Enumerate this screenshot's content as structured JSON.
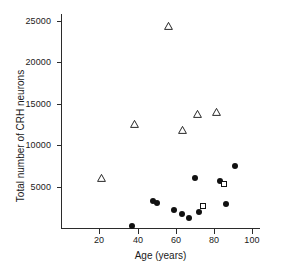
{
  "chart_data": {
    "type": "scatter",
    "title": "",
    "xlabel": "Age (years)",
    "ylabel": "Total number of  CRH neurons",
    "xlim": [
      0,
      104
    ],
    "ylim": [
      0,
      25800
    ],
    "xticks": [
      20,
      40,
      60,
      80,
      100
    ],
    "yticks": [
      5000,
      10000,
      15000,
      20000,
      25000
    ],
    "xtick_labels": [
      "20",
      "40",
      "60",
      "80",
      "100"
    ],
    "ytick_labels": [
      "5000",
      "10000",
      "15000",
      "20000",
      "25000"
    ],
    "grid": false,
    "legend": false,
    "marker_colors": {
      "filled_circle": "#111111",
      "open_triangle": "#111111",
      "open_square": "#111111",
      "axis": "#2b2b2b",
      "background": "#ffffff"
    },
    "series": [
      {
        "name": "open-triangle",
        "marker": "triangle-open",
        "points": [
          {
            "x": 21,
            "y": 6000
          },
          {
            "x": 38,
            "y": 12500
          },
          {
            "x": 56,
            "y": 24300
          },
          {
            "x": 63,
            "y": 11800
          },
          {
            "x": 71,
            "y": 13800
          },
          {
            "x": 81,
            "y": 14000
          }
        ]
      },
      {
        "name": "filled-circle",
        "marker": "circle-filled",
        "points": [
          {
            "x": 37,
            "y": 250
          },
          {
            "x": 48,
            "y": 3300
          },
          {
            "x": 50,
            "y": 3000
          },
          {
            "x": 59,
            "y": 2150
          },
          {
            "x": 63,
            "y": 1750
          },
          {
            "x": 67,
            "y": 1200
          },
          {
            "x": 70,
            "y": 6050
          },
          {
            "x": 72,
            "y": 1900
          },
          {
            "x": 83,
            "y": 5650
          },
          {
            "x": 86,
            "y": 2950
          },
          {
            "x": 91,
            "y": 7500
          }
        ]
      },
      {
        "name": "open-square",
        "marker": "square-open",
        "points": [
          {
            "x": 74,
            "y": 2600
          },
          {
            "x": 85,
            "y": 5350
          }
        ]
      }
    ]
  }
}
